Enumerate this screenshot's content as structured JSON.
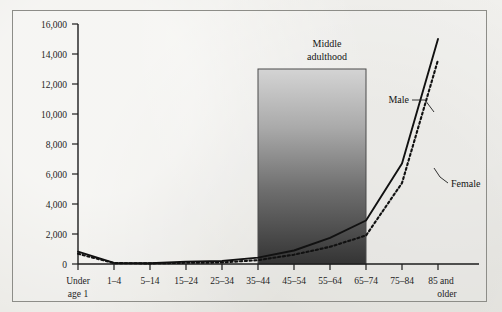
{
  "figure": {
    "background_color": "#e9e8e3",
    "frame_color": "#8d8d88",
    "axis_color": "#1d1d1d"
  },
  "chart_data": {
    "type": "line",
    "title": "",
    "subtitle": "",
    "xlabel": "",
    "ylabel": "",
    "grid": false,
    "legend_position": "inline-annotation",
    "categories": [
      "Under age 1",
      "1–4",
      "5–14",
      "15–24",
      "25–34",
      "35–44",
      "45–54",
      "55–64",
      "65–74",
      "75–84",
      "85 and older"
    ],
    "x_tick_labels": [
      [
        "Under",
        "age 1"
      ],
      [
        "1–4"
      ],
      [
        "5–14"
      ],
      [
        "15–24"
      ],
      [
        "25–34"
      ],
      [
        "35–44"
      ],
      [
        "45–54"
      ],
      [
        "55–64"
      ],
      [
        "65–74"
      ],
      [
        "75–84"
      ],
      [
        "85 and",
        "older"
      ]
    ],
    "ylim": [
      0,
      16000
    ],
    "y_ticks": [
      0,
      2000,
      4000,
      6000,
      8000,
      10000,
      12000,
      14000,
      16000
    ],
    "y_tick_labels": [
      "0",
      "2,000",
      "4,000",
      "6,000",
      "8,000",
      "10,000",
      "12,000",
      "14,000",
      "16,000"
    ],
    "series": [
      {
        "name": "Male",
        "style": "solid",
        "color": "#111111",
        "values": [
          820,
          70,
          50,
          160,
          200,
          430,
          900,
          1750,
          2900,
          6700,
          15000
        ]
      },
      {
        "name": "Female",
        "style": "dotted",
        "color": "#111111",
        "values": [
          680,
          60,
          40,
          80,
          100,
          260,
          620,
          1150,
          1900,
          5400,
          13600
        ]
      }
    ],
    "annotations": [
      {
        "name": "middle-adulthood-band",
        "label": [
          "Middle",
          "adulthood"
        ],
        "type": "shaded-rect",
        "x_start_category": "35–44",
        "x_end_category": "65–74",
        "y_top": 13000,
        "y_bottom": 0,
        "gradient_from": "#d2d2d2",
        "gradient_to": "#3a3a3a",
        "border_color": "#4a4a4a"
      },
      {
        "name": "male-series-label",
        "label": "Male",
        "type": "leader-line"
      },
      {
        "name": "female-series-label",
        "label": "Female",
        "type": "leader-line"
      }
    ]
  }
}
